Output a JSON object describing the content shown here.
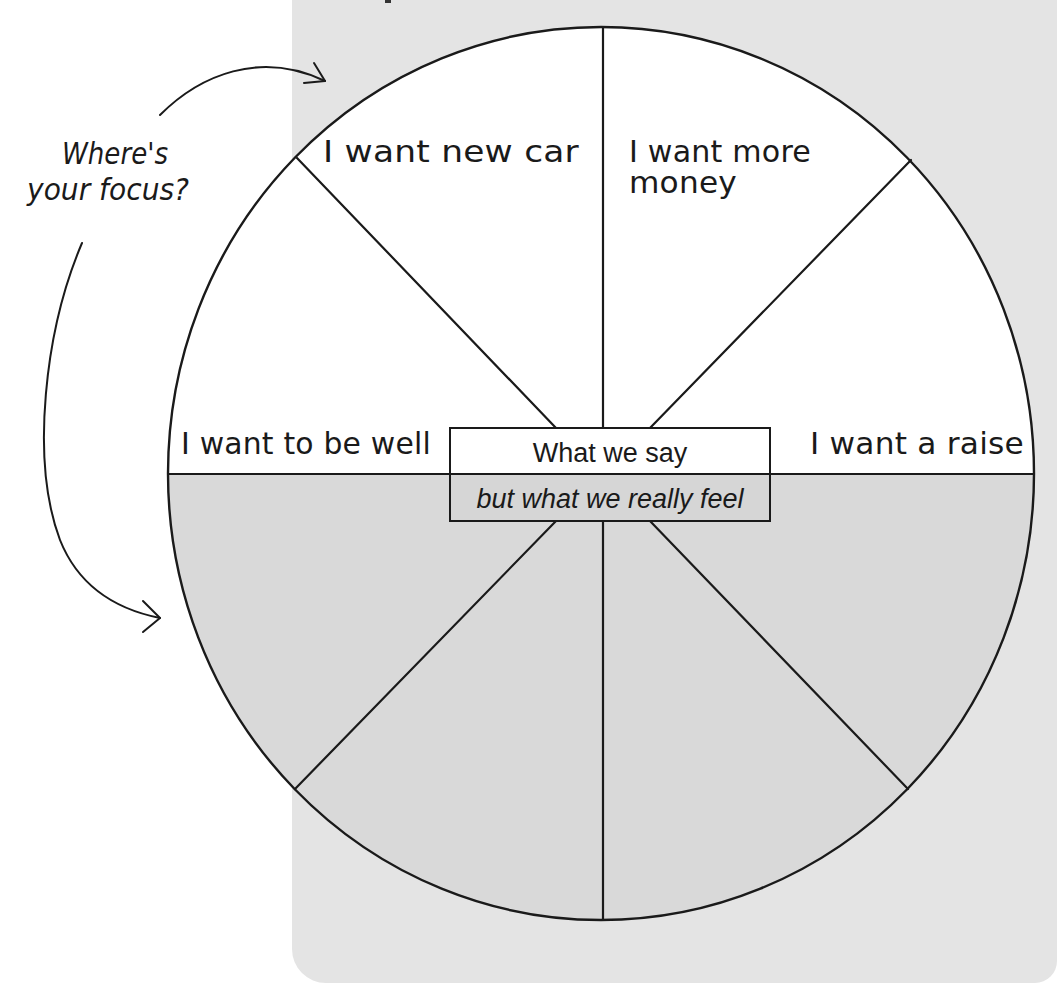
{
  "diagram": {
    "type": "circle-split",
    "prompt": {
      "line1": "Where's",
      "line2": "your focus?"
    },
    "top_labels": {
      "upper_left": "I want  new car",
      "upper_right_line1": "I want more",
      "upper_right_line2": "money",
      "left": "I want to be well",
      "right": "I want a raise"
    },
    "center_box": {
      "top": "What we say",
      "bottom": "but what we really feel"
    },
    "colors": {
      "panel": "#e4e4e4",
      "upper_half": "#ffffff",
      "lower_half": "#d9d9d9",
      "line": "#1a1a1a"
    },
    "segments": 8
  }
}
